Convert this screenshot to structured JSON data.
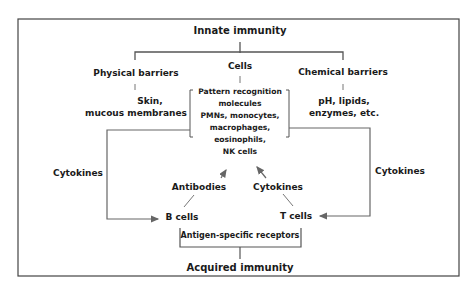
{
  "diagram": {
    "title_top": "Innate immunity",
    "branches": {
      "physical": {
        "label": "Physical barriers",
        "detail_line1": "Skin,",
        "detail_line2": "mucous membranes"
      },
      "cells": {
        "label": "Cells",
        "detail_lines": [
          "Pattern recognition",
          "molecules",
          "PMNs, monocytes,",
          "macrophages,",
          "eosinophils,",
          "NK cells"
        ]
      },
      "chemical": {
        "label": "Chemical barriers",
        "detail_line1": "pH, lipids,",
        "detail_line2": "enzymes, etc."
      }
    },
    "left_loop_label": "Cytokines",
    "right_loop_label": "Cytokines",
    "antibodies_label": "Antibodies",
    "center_cytokines_label": "Cytokines",
    "b_cells": "B cells",
    "t_cells": "T cells",
    "receptors_label": "Antigen-specific receptors",
    "title_bottom": "Acquired immunity"
  },
  "colors": {
    "line": "#555555",
    "text": "#1a1a1a",
    "border": "#444444"
  }
}
